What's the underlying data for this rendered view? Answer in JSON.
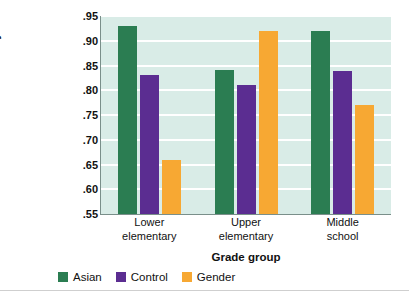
{
  "chart_data": {
    "type": "bar",
    "title": "",
    "xlabel": "Grade group",
    "ylabel": "Math test accuracy",
    "categories": [
      "Lower elementary",
      "Upper elementary",
      "Middle school"
    ],
    "category_lines": [
      [
        "Lower",
        "elementary"
      ],
      [
        "Upper",
        "elementary"
      ],
      [
        "Middle",
        "school"
      ]
    ],
    "series": [
      {
        "name": "Asian",
        "color": "#2b7d52",
        "values": [
          0.93,
          0.84,
          0.92
        ]
      },
      {
        "name": "Control",
        "color": "#5b2d91",
        "values": [
          0.83,
          0.81,
          0.838
        ]
      },
      {
        "name": "Gender",
        "color": "#f7a833",
        "values": [
          0.66,
          0.92,
          0.77
        ]
      }
    ],
    "ylim": [
      0.55,
      0.95
    ],
    "yticks": [
      0.95,
      0.9,
      0.85,
      0.8,
      0.75,
      0.7,
      0.65,
      0.6,
      0.55
    ],
    "ytick_labels": [
      ".95",
      ".90",
      ".85",
      ".80",
      ".75",
      ".70",
      ".65",
      ".60",
      ".55"
    ],
    "grid": true,
    "gridline_color": "#ffffff",
    "plot_background": "#d9ece7",
    "legend_position": "bottom-left"
  },
  "legend": {
    "items": [
      {
        "label": "Asian",
        "color": "#2b7d52"
      },
      {
        "label": "Control",
        "color": "#5b2d91"
      },
      {
        "label": "Gender",
        "color": "#f7a833"
      }
    ]
  }
}
